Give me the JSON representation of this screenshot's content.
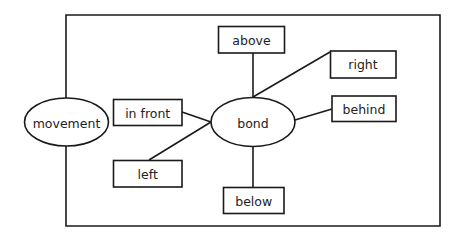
{
  "diagram": {
    "type": "concept-map",
    "colors": {
      "stroke": "#1a1a1a",
      "text": "#222222",
      "background": "#ffffff"
    },
    "nodes": {
      "movement": {
        "label": "movement",
        "shape": "ellipse"
      },
      "bond": {
        "label": "bond",
        "shape": "ellipse"
      },
      "above": {
        "label": "above",
        "shape": "rect"
      },
      "right": {
        "label": "right",
        "shape": "rect"
      },
      "behind": {
        "label": "behind",
        "shape": "rect"
      },
      "in_front": {
        "label": "in front",
        "shape": "rect"
      },
      "left": {
        "label": "left",
        "shape": "rect"
      },
      "below": {
        "label": "below",
        "shape": "rect"
      }
    },
    "edges": [
      {
        "from": "movement",
        "to": "bond",
        "style": "frame-enclosure"
      },
      {
        "from": "bond",
        "to": "above"
      },
      {
        "from": "bond",
        "to": "right"
      },
      {
        "from": "bond",
        "to": "behind"
      },
      {
        "from": "bond",
        "to": "in_front"
      },
      {
        "from": "bond",
        "to": "left"
      },
      {
        "from": "bond",
        "to": "below"
      }
    ]
  }
}
